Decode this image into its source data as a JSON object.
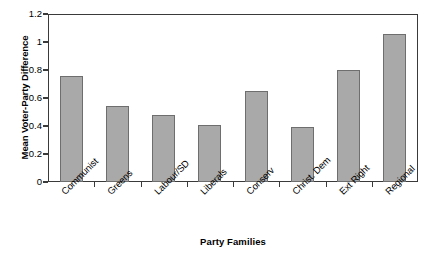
{
  "chart_data": {
    "type": "bar",
    "title": "",
    "xlabel": "Party Families",
    "ylabel": "Mean Voter-Party Difference",
    "categories": [
      "Communist",
      "Greens",
      "Labour/SD",
      "Liberals",
      "Conserv",
      "Christ. Dem",
      "Ext Right",
      "Regional"
    ],
    "values": [
      0.76,
      0.54,
      0.48,
      0.41,
      0.65,
      0.39,
      0.8,
      1.06
    ],
    "ylim": [
      0,
      1.2
    ],
    "yticks": [
      0,
      0.2,
      0.4,
      0.6,
      0.8,
      1,
      1.2
    ],
    "ytick_labels": [
      "0",
      "0.2",
      "0.4",
      "0.6",
      "0.8",
      "1",
      "1.2"
    ],
    "grid": false,
    "legend": "none",
    "bar_color": "#a9a9a9",
    "bar_edge_color": "#6e6e6e",
    "axis_color": "#3a3a3a"
  }
}
